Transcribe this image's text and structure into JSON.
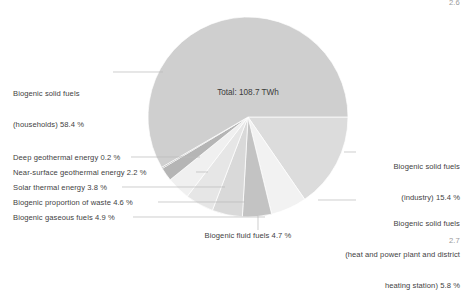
{
  "page": {
    "corner_top_right": "2.6",
    "corner_bottom_right": "2.7"
  },
  "center": {
    "total_text": "Total: 108.7 TWh"
  },
  "labels": {
    "households_line1": "Biogenic solid fuels",
    "households_line2": "(households) 58.4 %",
    "deep_geothermal": "Deep geothermal energy 0.2 %",
    "near_surface_geothermal": "Near-surface geothermal energy 2.2 %",
    "solar_thermal": "Solar thermal energy 3.8 %",
    "waste": "Biogenic proportion of waste 4.6 %",
    "gaseous": "Biogenic gaseous fuels 4.9 %",
    "fluid": "Biogenic fluid fuels 4.7 %",
    "industry_line1": "Biogenic solid fuels",
    "industry_line2": "(industry) 15.4 %",
    "chp_line1": "Biogenic solid fuels",
    "chp_line2": "(heat and power plant and district",
    "chp_line3": "heating station) 5.8 %"
  },
  "chart_data": {
    "type": "pie",
    "title": "",
    "total_label": "Total: 108.7 TWh",
    "total_value": 108.7,
    "unit": "TWh",
    "value_unit": "percent",
    "start_angle_deg": 0,
    "direction": "clockwise",
    "legend": "callout-labels",
    "grid": false,
    "slices": [
      {
        "name": "Biogenic solid fuels (industry)",
        "value": 15.4,
        "color": "#dcdcdc"
      },
      {
        "name": "Biogenic solid fuels (heat and power plant and district heating station)",
        "value": 5.8,
        "color": "#f2f2f2"
      },
      {
        "name": "Biogenic fluid fuels",
        "value": 4.7,
        "color": "#c3c3c3"
      },
      {
        "name": "Biogenic gaseous fuels",
        "value": 4.9,
        "color": "#d9d9d9"
      },
      {
        "name": "Biogenic proportion of waste",
        "value": 4.6,
        "color": "#e6e6e6"
      },
      {
        "name": "Solar thermal energy",
        "value": 3.8,
        "color": "#f0f0f0"
      },
      {
        "name": "Near-surface geothermal energy",
        "value": 2.2,
        "color": "#b5b5b5"
      },
      {
        "name": "Deep geothermal energy",
        "value": 0.2,
        "color": "#9c9c9c"
      },
      {
        "name": "Biogenic solid fuels (households)",
        "value": 58.4,
        "color": "#cfcfcf"
      }
    ]
  },
  "geometry": {
    "cx": 248,
    "cy": 117,
    "r": 100
  },
  "colors": {
    "leader_line": "#b9b9b9",
    "text": "#3f3f3f",
    "corner": "#9a9a9a"
  }
}
